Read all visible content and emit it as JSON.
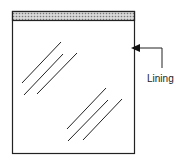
{
  "diagram": {
    "title": "",
    "components": [
      {
        "id": "bag",
        "type": "rectangle",
        "description": "Bag body"
      },
      {
        "id": "top-strip",
        "type": "hatched-band",
        "description": "Top seal strip"
      },
      {
        "id": "glare-marks",
        "type": "diagonal-lines",
        "description": "Transparency marks"
      }
    ],
    "labels": {
      "lining": "Lining"
    },
    "colors": {
      "stroke": "#222222",
      "strip_fill": "#bbbbbb",
      "background": "#ffffff"
    }
  }
}
